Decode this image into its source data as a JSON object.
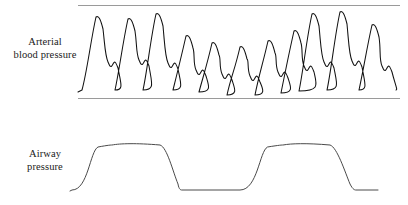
{
  "figure": {
    "width": 408,
    "height": 205,
    "background_color": "#ffffff"
  },
  "labels": {
    "abp_line1": "Arterial",
    "abp_line2": "blood pressure",
    "awp_line1": "Airway",
    "awp_line2": "pressure"
  },
  "style": {
    "trace_color": "#111111",
    "airway_trace_color": "#4a4a4a",
    "rule_color": "#9a9a9a",
    "text_color": "#1a1a1a"
  },
  "chart_data": {
    "type": "line",
    "xlabel": "",
    "ylabel": "",
    "grid": false,
    "legend_position": "left",
    "annotations": [
      "Arterial pulse amplitude falls during the ventilator inspiratory plateau and recovers during expiration (pulsus paradoxus / respiratory variation)."
    ],
    "panels": [
      {
        "name": "arterial-blood-pressure",
        "label": "Arterial blood pressure",
        "plot_box": {
          "x0": 78,
          "x1": 400,
          "y_top": 5,
          "y_bottom": 98
        },
        "baselines": [
          {
            "name": "upper-rule",
            "y": 5,
            "x0": 78,
            "x1": 400
          },
          {
            "name": "lower-rule",
            "y": 98,
            "x0": 78,
            "x1": 400
          }
        ],
        "beat_count": 12,
        "beats": [
          {
            "index": 1,
            "peak_x": 96,
            "peak_y": 17,
            "trough_y": 90,
            "notch_x": 108,
            "notch_y": 62,
            "amplitude": "large"
          },
          {
            "index": 2,
            "peak_x": 128,
            "peak_y": 19,
            "trough_y": 90,
            "notch_x": 139,
            "notch_y": 60,
            "amplitude": "large"
          },
          {
            "index": 3,
            "peak_x": 156,
            "peak_y": 14,
            "trough_y": 90,
            "notch_x": 168,
            "notch_y": 63,
            "amplitude": "large"
          },
          {
            "index": 4,
            "peak_x": 186,
            "peak_y": 36,
            "trough_y": 92,
            "notch_x": 196,
            "notch_y": 70,
            "amplitude": "medium"
          },
          {
            "index": 5,
            "peak_x": 212,
            "peak_y": 43,
            "trough_y": 95,
            "notch_x": 222,
            "notch_y": 74,
            "amplitude": "small"
          },
          {
            "index": 6,
            "peak_x": 240,
            "peak_y": 47,
            "trough_y": 95,
            "notch_x": 250,
            "notch_y": 76,
            "amplitude": "small"
          },
          {
            "index": 7,
            "peak_x": 268,
            "peak_y": 41,
            "trough_y": 93,
            "notch_x": 278,
            "notch_y": 72,
            "amplitude": "small"
          },
          {
            "index": 8,
            "peak_x": 294,
            "peak_y": 31,
            "trough_y": 91,
            "notch_x": 304,
            "notch_y": 66,
            "amplitude": "medium"
          },
          {
            "index": 9,
            "peak_x": 312,
            "peak_y": 14,
            "trough_y": 90,
            "notch_x": 324,
            "notch_y": 62,
            "amplitude": "large"
          },
          {
            "index": 10,
            "peak_x": 340,
            "peak_y": 12,
            "trough_y": 90,
            "notch_x": 352,
            "notch_y": 61,
            "amplitude": "large"
          },
          {
            "index": 11,
            "peak_x": 372,
            "peak_y": 25,
            "trough_y": 90,
            "notch_x": 382,
            "notch_y": 66,
            "amplitude": "medium"
          }
        ]
      },
      {
        "name": "airway-pressure",
        "label": "Airway pressure",
        "plot_box": {
          "x0": 72,
          "x1": 400,
          "y_top": 140,
          "y_bottom": 195
        },
        "baseline_y": 190,
        "plateau_y": 145,
        "breaths": [
          {
            "index": 1,
            "rise_start_x": 72,
            "rise_end_x": 112,
            "plateau_start_x": 112,
            "plateau_end_x": 160,
            "fall_start_x": 160,
            "fall_end_x": 182
          },
          {
            "index": 2,
            "rise_start_x": 240,
            "rise_end_x": 283,
            "plateau_start_x": 283,
            "plateau_end_x": 330,
            "fall_start_x": 330,
            "fall_end_x": 356
          }
        ],
        "expiratory_segments": [
          {
            "x0": 182,
            "x1": 240,
            "y": 190
          },
          {
            "x0": 356,
            "x1": 378,
            "y": 190
          }
        ]
      }
    ]
  }
}
